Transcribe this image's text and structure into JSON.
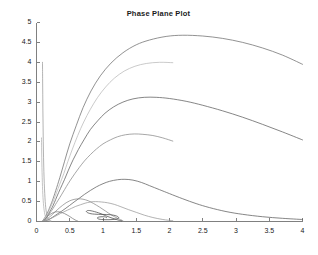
{
  "figure": {
    "width": 317,
    "height": 255,
    "background_color": "#ffffff",
    "axis_color": "#808080",
    "tick_label_color": "#1a1a1a",
    "title_color": "#1a1a1a"
  },
  "chart_data": {
    "type": "line",
    "title": "Phase Plane Plot",
    "xlabel": "",
    "ylabel": "",
    "xlim": [
      0,
      4
    ],
    "ylim": [
      0,
      5
    ],
    "grid": false,
    "legend": "none",
    "box": "off",
    "xticks": [
      0,
      0.5,
      1,
      1.5,
      2,
      2.5,
      3,
      3.5,
      4
    ],
    "xtick_labels": [
      "0",
      "0.5",
      "1",
      "1.5",
      "2",
      "2.5",
      "3",
      "3.5",
      "4"
    ],
    "yticks": [
      0,
      0.5,
      1,
      1.5,
      2,
      2.5,
      3,
      3.5,
      4,
      4.5,
      5
    ],
    "ytick_labels": [
      "0",
      "0.5",
      "1",
      "1.5",
      "2",
      "2.5",
      "3",
      "3.5",
      "4",
      "4.5",
      "5"
    ],
    "equilibrium_point": [
      1.0,
      0.1
    ],
    "series": [
      {
        "name": "trajectory-1",
        "color": "#6e6e6e",
        "points": [
          [
            4.0,
            3.95
          ],
          [
            3.7,
            4.18
          ],
          [
            3.4,
            4.36
          ],
          [
            3.1,
            4.5
          ],
          [
            2.8,
            4.6
          ],
          [
            2.5,
            4.66
          ],
          [
            2.2,
            4.68
          ],
          [
            1.95,
            4.65
          ],
          [
            1.7,
            4.56
          ],
          [
            1.5,
            4.44
          ],
          [
            1.3,
            4.24
          ],
          [
            1.12,
            3.98
          ],
          [
            0.96,
            3.66
          ],
          [
            0.82,
            3.28
          ],
          [
            0.7,
            2.86
          ],
          [
            0.6,
            2.42
          ],
          [
            0.5,
            1.95
          ],
          [
            0.42,
            1.5
          ],
          [
            0.35,
            1.1
          ],
          [
            0.29,
            0.78
          ],
          [
            0.24,
            0.53
          ],
          [
            0.2,
            0.36
          ],
          [
            0.17,
            0.24
          ],
          [
            0.145,
            0.16
          ],
          [
            0.125,
            0.1
          ],
          [
            0.11,
            0.06
          ],
          [
            0.1,
            0.035
          ],
          [
            0.09,
            0.02
          ]
        ]
      },
      {
        "name": "trajectory-2",
        "color": "#b8b8b8",
        "points": [
          [
            2.05,
            3.99
          ],
          [
            1.85,
            4.0
          ],
          [
            1.65,
            3.97
          ],
          [
            1.48,
            3.9
          ],
          [
            1.32,
            3.78
          ],
          [
            1.17,
            3.6
          ],
          [
            1.04,
            3.38
          ],
          [
            0.92,
            3.12
          ],
          [
            0.81,
            2.82
          ],
          [
            0.71,
            2.5
          ],
          [
            0.62,
            2.16
          ],
          [
            0.54,
            1.82
          ],
          [
            0.47,
            1.5
          ],
          [
            0.41,
            1.2
          ],
          [
            0.35,
            0.94
          ],
          [
            0.3,
            0.72
          ],
          [
            0.26,
            0.54
          ],
          [
            0.22,
            0.39
          ],
          [
            0.19,
            0.28
          ],
          [
            0.165,
            0.19
          ],
          [
            0.145,
            0.13
          ],
          [
            0.13,
            0.085
          ],
          [
            0.115,
            0.05
          ],
          [
            0.105,
            0.03
          ]
        ]
      },
      {
        "name": "trajectory-3",
        "color": "#5e5e5e",
        "points": [
          [
            4.0,
            2.05
          ],
          [
            3.7,
            2.25
          ],
          [
            3.4,
            2.44
          ],
          [
            3.1,
            2.62
          ],
          [
            2.8,
            2.78
          ],
          [
            2.5,
            2.92
          ],
          [
            2.25,
            3.02
          ],
          [
            2.0,
            3.09
          ],
          [
            1.8,
            3.12
          ],
          [
            1.62,
            3.12
          ],
          [
            1.45,
            3.08
          ],
          [
            1.3,
            3.0
          ],
          [
            1.16,
            2.88
          ],
          [
            1.03,
            2.72
          ],
          [
            0.92,
            2.53
          ],
          [
            0.81,
            2.31
          ],
          [
            0.72,
            2.07
          ],
          [
            0.63,
            1.81
          ],
          [
            0.55,
            1.55
          ],
          [
            0.48,
            1.29
          ],
          [
            0.42,
            1.05
          ],
          [
            0.36,
            0.83
          ],
          [
            0.31,
            0.64
          ],
          [
            0.27,
            0.48
          ],
          [
            0.235,
            0.35
          ],
          [
            0.2,
            0.25
          ],
          [
            0.175,
            0.17
          ],
          [
            0.155,
            0.11
          ],
          [
            0.14,
            0.07
          ],
          [
            0.125,
            0.045
          ],
          [
            0.115,
            0.028
          ]
        ]
      },
      {
        "name": "trajectory-4",
        "color": "#8a8a8a",
        "points": [
          [
            2.05,
            2.02
          ],
          [
            1.9,
            2.1
          ],
          [
            1.75,
            2.16
          ],
          [
            1.6,
            2.19
          ],
          [
            1.47,
            2.2
          ],
          [
            1.34,
            2.18
          ],
          [
            1.22,
            2.13
          ],
          [
            1.11,
            2.05
          ],
          [
            1.0,
            1.95
          ],
          [
            0.9,
            1.82
          ],
          [
            0.81,
            1.68
          ],
          [
            0.72,
            1.52
          ],
          [
            0.645,
            1.36
          ],
          [
            0.575,
            1.2
          ],
          [
            0.51,
            1.04
          ],
          [
            0.45,
            0.88
          ],
          [
            0.4,
            0.74
          ],
          [
            0.35,
            0.6
          ],
          [
            0.305,
            0.48
          ],
          [
            0.265,
            0.37
          ],
          [
            0.23,
            0.28
          ],
          [
            0.2,
            0.21
          ],
          [
            0.175,
            0.15
          ],
          [
            0.155,
            0.105
          ],
          [
            0.138,
            0.07
          ],
          [
            0.125,
            0.045
          ],
          [
            0.115,
            0.028
          ]
        ]
      },
      {
        "name": "trajectory-5",
        "color": "#5e5e5e",
        "points": [
          [
            4.0,
            0.05
          ],
          [
            3.7,
            0.08
          ],
          [
            3.4,
            0.12
          ],
          [
            3.1,
            0.18
          ],
          [
            2.85,
            0.25
          ],
          [
            2.6,
            0.35
          ],
          [
            2.4,
            0.45
          ],
          [
            2.2,
            0.57
          ],
          [
            2.0,
            0.7
          ],
          [
            1.85,
            0.8
          ],
          [
            1.7,
            0.9
          ],
          [
            1.58,
            0.98
          ],
          [
            1.45,
            1.04
          ],
          [
            1.33,
            1.06
          ],
          [
            1.22,
            1.05
          ],
          [
            1.1,
            1.01
          ],
          [
            1.0,
            0.95
          ],
          [
            0.9,
            0.87
          ],
          [
            0.81,
            0.78
          ],
          [
            0.72,
            0.68
          ],
          [
            0.64,
            0.58
          ],
          [
            0.565,
            0.49
          ],
          [
            0.495,
            0.4
          ],
          [
            0.43,
            0.32
          ],
          [
            0.375,
            0.255
          ],
          [
            0.325,
            0.2
          ],
          [
            0.28,
            0.15
          ],
          [
            0.245,
            0.11
          ],
          [
            0.215,
            0.08
          ],
          [
            0.19,
            0.055
          ],
          [
            0.17,
            0.038
          ],
          [
            0.15,
            0.025
          ],
          [
            0.135,
            0.016
          ]
        ]
      },
      {
        "name": "trajectory-6",
        "color": "#8a8a8a",
        "points": [
          [
            1.3,
            0.02
          ],
          [
            1.22,
            0.08
          ],
          [
            1.13,
            0.16
          ],
          [
            1.04,
            0.26
          ],
          [
            0.95,
            0.36
          ],
          [
            0.86,
            0.45
          ],
          [
            0.78,
            0.52
          ],
          [
            0.7,
            0.56
          ],
          [
            0.63,
            0.57
          ],
          [
            0.565,
            0.555
          ],
          [
            0.5,
            0.52
          ],
          [
            0.445,
            0.47
          ],
          [
            0.395,
            0.41
          ],
          [
            0.35,
            0.35
          ],
          [
            0.31,
            0.29
          ],
          [
            0.275,
            0.235
          ],
          [
            0.245,
            0.185
          ],
          [
            0.215,
            0.14
          ],
          [
            0.19,
            0.105
          ],
          [
            0.17,
            0.075
          ],
          [
            0.152,
            0.052
          ],
          [
            0.138,
            0.035
          ],
          [
            0.125,
            0.022
          ],
          [
            0.115,
            0.013
          ]
        ]
      },
      {
        "name": "trajectory-7",
        "color": "#9a9a9a",
        "points": [
          [
            2.05,
            0.02
          ],
          [
            1.9,
            0.05
          ],
          [
            1.75,
            0.1
          ],
          [
            1.62,
            0.16
          ],
          [
            1.5,
            0.23
          ],
          [
            1.38,
            0.3
          ],
          [
            1.27,
            0.37
          ],
          [
            1.17,
            0.43
          ],
          [
            1.07,
            0.47
          ],
          [
            0.98,
            0.49
          ],
          [
            0.89,
            0.5
          ],
          [
            0.81,
            0.49
          ],
          [
            0.73,
            0.46
          ],
          [
            0.66,
            0.42
          ],
          [
            0.59,
            0.38
          ],
          [
            0.525,
            0.33
          ],
          [
            0.465,
            0.285
          ],
          [
            0.41,
            0.24
          ],
          [
            0.36,
            0.2
          ],
          [
            0.315,
            0.16
          ],
          [
            0.275,
            0.125
          ],
          [
            0.24,
            0.095
          ],
          [
            0.21,
            0.07
          ],
          [
            0.185,
            0.05
          ],
          [
            0.165,
            0.035
          ],
          [
            0.148,
            0.022
          ],
          [
            0.132,
            0.014
          ]
        ]
      },
      {
        "name": "trajectory-8",
        "color": "#4a4a4a",
        "points": [
          [
            1.28,
            0.015
          ],
          [
            1.2,
            0.05
          ],
          [
            1.12,
            0.095
          ],
          [
            1.04,
            0.145
          ],
          [
            0.97,
            0.195
          ],
          [
            0.9,
            0.235
          ],
          [
            0.845,
            0.26
          ],
          [
            0.8,
            0.275
          ],
          [
            0.77,
            0.275
          ],
          [
            0.755,
            0.265
          ],
          [
            0.75,
            0.25
          ],
          [
            0.76,
            0.23
          ],
          [
            0.785,
            0.21
          ],
          [
            0.82,
            0.195
          ],
          [
            0.87,
            0.185
          ],
          [
            0.93,
            0.18
          ],
          [
            0.99,
            0.178
          ],
          [
            1.05,
            0.175
          ],
          [
            1.11,
            0.17
          ],
          [
            1.16,
            0.158
          ],
          [
            1.2,
            0.14
          ],
          [
            1.225,
            0.12
          ],
          [
            1.235,
            0.1
          ],
          [
            1.23,
            0.08
          ],
          [
            1.2,
            0.062
          ],
          [
            1.15,
            0.05
          ],
          [
            1.09,
            0.045
          ],
          [
            1.03,
            0.045
          ],
          [
            0.98,
            0.05
          ],
          [
            0.94,
            0.06
          ],
          [
            0.92,
            0.075
          ],
          [
            0.915,
            0.09
          ],
          [
            0.925,
            0.105
          ],
          [
            0.95,
            0.115
          ],
          [
            0.985,
            0.12
          ],
          [
            1.02,
            0.118
          ],
          [
            1.045,
            0.11
          ],
          [
            1.055,
            0.1
          ],
          [
            1.05,
            0.092
          ]
        ]
      },
      {
        "name": "trajectory-9",
        "color": "#9a9a9a",
        "points": [
          [
            0.09,
            4.0
          ],
          [
            0.092,
            3.6
          ],
          [
            0.094,
            3.2
          ],
          [
            0.096,
            2.8
          ],
          [
            0.099,
            2.4
          ],
          [
            0.102,
            2.0
          ],
          [
            0.106,
            1.6
          ],
          [
            0.111,
            1.25
          ],
          [
            0.117,
            0.95
          ],
          [
            0.124,
            0.7
          ],
          [
            0.131,
            0.5
          ],
          [
            0.139,
            0.35
          ],
          [
            0.147,
            0.24
          ],
          [
            0.156,
            0.16
          ],
          [
            0.166,
            0.105
          ],
          [
            0.178,
            0.065
          ],
          [
            0.19,
            0.04
          ],
          [
            0.205,
            0.022
          ],
          [
            0.22,
            0.012
          ]
        ]
      },
      {
        "name": "trajectory-10",
        "color": "#b0b0b0",
        "points": [
          [
            0.075,
            2.1
          ],
          [
            0.077,
            1.85
          ],
          [
            0.079,
            1.6
          ],
          [
            0.082,
            1.35
          ],
          [
            0.086,
            1.1
          ],
          [
            0.09,
            0.88
          ],
          [
            0.095,
            0.68
          ],
          [
            0.101,
            0.52
          ],
          [
            0.108,
            0.38
          ],
          [
            0.116,
            0.27
          ],
          [
            0.125,
            0.185
          ],
          [
            0.135,
            0.125
          ],
          [
            0.147,
            0.08
          ],
          [
            0.16,
            0.05
          ],
          [
            0.175,
            0.03
          ],
          [
            0.192,
            0.017
          ],
          [
            0.21,
            0.009
          ]
        ]
      },
      {
        "name": "trajectory-11",
        "color": "#7a7a7a",
        "points": [
          [
            0.62,
            0.01
          ],
          [
            0.58,
            0.04
          ],
          [
            0.54,
            0.08
          ],
          [
            0.5,
            0.125
          ],
          [
            0.46,
            0.165
          ],
          [
            0.42,
            0.2
          ],
          [
            0.385,
            0.225
          ],
          [
            0.35,
            0.24
          ],
          [
            0.315,
            0.245
          ],
          [
            0.285,
            0.24
          ],
          [
            0.255,
            0.225
          ],
          [
            0.23,
            0.205
          ],
          [
            0.205,
            0.18
          ],
          [
            0.185,
            0.155
          ],
          [
            0.167,
            0.13
          ],
          [
            0.152,
            0.105
          ],
          [
            0.14,
            0.082
          ],
          [
            0.13,
            0.062
          ],
          [
            0.122,
            0.045
          ],
          [
            0.115,
            0.032
          ],
          [
            0.11,
            0.021
          ],
          [
            0.106,
            0.013
          ]
        ]
      }
    ]
  }
}
